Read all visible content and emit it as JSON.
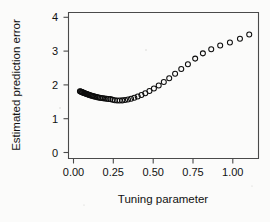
{
  "chart_data": {
    "type": "scatter",
    "title": "",
    "xlabel": "Tuning parameter",
    "ylabel": "Estimated prediction error",
    "xlim": [
      -0.07,
      1.16
    ],
    "ylim": [
      0,
      4.18
    ],
    "xticks": [
      0.0,
      0.25,
      0.5,
      0.75,
      1.0
    ],
    "xticklabels": [
      "0.00",
      "0.25",
      "0.50",
      "0.75",
      "1.00"
    ],
    "yticks": [
      0,
      1,
      2,
      3,
      4
    ],
    "yticklabels": [
      "0",
      "1",
      "2",
      "3",
      "4"
    ],
    "grid": false,
    "legend": null,
    "marker": "open-circle",
    "marker_color": "#0d0d0d",
    "series": [
      {
        "name": "Estimated prediction error",
        "x": [
          0.004,
          0.008,
          0.012,
          0.017,
          0.021,
          0.026,
          0.031,
          0.036,
          0.042,
          0.048,
          0.054,
          0.06,
          0.067,
          0.074,
          0.081,
          0.089,
          0.097,
          0.105,
          0.114,
          0.123,
          0.133,
          0.143,
          0.154,
          0.165,
          0.177,
          0.189,
          0.202,
          0.216,
          0.23,
          0.245,
          0.261,
          0.278,
          0.296,
          0.315,
          0.335,
          0.356,
          0.378,
          0.402,
          0.427,
          0.454,
          0.483,
          0.514,
          0.547,
          0.582,
          0.62,
          0.66,
          0.703,
          0.75,
          0.8,
          0.854,
          0.912,
          0.975,
          1.04,
          1.1
        ],
        "y": [
          1.925,
          1.918,
          1.91,
          1.902,
          1.893,
          1.884,
          1.875,
          1.866,
          1.856,
          1.846,
          1.836,
          1.826,
          1.816,
          1.806,
          1.796,
          1.786,
          1.776,
          1.767,
          1.758,
          1.749,
          1.741,
          1.733,
          1.726,
          1.719,
          1.712,
          1.706,
          1.7,
          1.68,
          1.668,
          1.662,
          1.66,
          1.664,
          1.674,
          1.69,
          1.712,
          1.74,
          1.775,
          1.818,
          1.87,
          1.932,
          2.005,
          2.09,
          2.19,
          2.3,
          2.425,
          2.56,
          2.7,
          2.86,
          3.01,
          3.13,
          3.235,
          3.32,
          3.43,
          3.55
        ]
      }
    ]
  }
}
